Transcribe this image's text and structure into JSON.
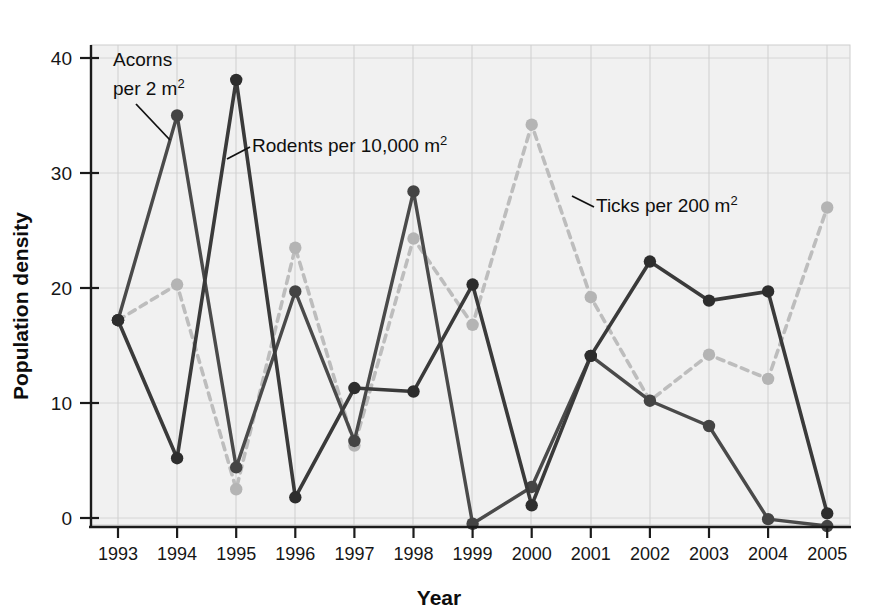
{
  "chart_data": {
    "type": "line",
    "title": "",
    "xlabel": "Year",
    "ylabel": "Population density",
    "x": [
      1993,
      1994,
      1995,
      1996,
      1997,
      1998,
      1999,
      2000,
      2001,
      2002,
      2003,
      2004,
      2005
    ],
    "categories": [
      "1993",
      "1994",
      "1995",
      "1996",
      "1997",
      "1998",
      "1999",
      "2000",
      "2001",
      "2002",
      "2003",
      "2004",
      "2005"
    ],
    "ylim": [
      -2,
      41
    ],
    "yticks": [
      0,
      10,
      20,
      30,
      40
    ],
    "ytick_labels": [
      "0",
      "10",
      "20",
      "30",
      "40"
    ],
    "xlim": [
      1992.4,
      2005.4
    ],
    "grid": true,
    "legend_position": "inline-annotations",
    "series": [
      {
        "name": "Acorns per 2 m²",
        "style": "solid",
        "color": "#4a4a4a",
        "values": [
          17.2,
          35.0,
          4.4,
          19.7,
          6.7,
          28.4,
          -0.5,
          2.7,
          14.1,
          10.2,
          8.0,
          -0.1,
          -0.7
        ]
      },
      {
        "name": "Rodents per 10,000 m²",
        "style": "solid",
        "color": "#3a3a3a",
        "values": [
          17.2,
          5.2,
          38.1,
          1.8,
          11.3,
          11.0,
          20.3,
          1.1,
          14.1,
          22.3,
          18.9,
          19.7,
          0.4
        ]
      },
      {
        "name": "Ticks per 200 m²",
        "style": "dashed",
        "color": "#bdbdbd",
        "values": [
          17.2,
          20.3,
          2.5,
          23.5,
          6.3,
          24.3,
          16.8,
          34.2,
          19.2,
          10.2,
          14.2,
          12.1,
          27.0
        ]
      }
    ],
    "annotations": [
      {
        "text_line1": "Acorns",
        "text_line2": "per 2 m",
        "sup": "2",
        "name": "acorns-label"
      },
      {
        "text": "Rodents per 10,000 m",
        "sup": "2",
        "name": "rodents-label"
      },
      {
        "text": "Ticks per 200 m",
        "sup": "2",
        "name": "ticks-label"
      }
    ]
  },
  "colors": {
    "plot_background": "#f1f1f1",
    "grid": "#d6d6d6",
    "axis": "#1b1b1b",
    "acorns": "#4a4a4a",
    "rodents": "#3a3a3a",
    "ticks": "#bdbdbd"
  }
}
